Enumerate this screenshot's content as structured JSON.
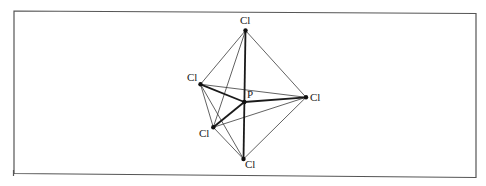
{
  "figure": {
    "central_atom": {
      "label": "P",
      "x": 244.3,
      "y": 102,
      "label_x": 247,
      "label_y": 98
    },
    "atoms": [
      {
        "id": "top",
        "label": "Cl",
        "x": 245.5,
        "y": 30.5,
        "label_x": 240,
        "label_y": 24
      },
      {
        "id": "left",
        "label": "Cl",
        "x": 200.5,
        "y": 84.3,
        "label_x": 187,
        "label_y": 81
      },
      {
        "id": "right",
        "label": "Cl",
        "x": 306,
        "y": 97.3,
        "label_x": 310,
        "label_y": 101
      },
      {
        "id": "lower-left",
        "label": "Cl",
        "x": 213.3,
        "y": 127.3,
        "label_x": 199,
        "label_y": 137
      },
      {
        "id": "bottom",
        "label": "Cl",
        "x": 243.5,
        "y": 159,
        "label_x": 245,
        "label_y": 168
      }
    ],
    "bonds_bold": [
      [
        "top",
        "bottom"
      ],
      [
        "P",
        "left"
      ],
      [
        "P",
        "right"
      ],
      [
        "P",
        "lower-left"
      ]
    ],
    "edges_thin": [
      [
        "top",
        "left"
      ],
      [
        "top",
        "lower-left"
      ],
      [
        "top",
        "right"
      ],
      [
        "left",
        "right"
      ],
      [
        "left",
        "lower-left"
      ],
      [
        "left",
        "bottom"
      ],
      [
        "lower-left",
        "right"
      ],
      [
        "lower-left",
        "bottom"
      ],
      [
        "right",
        "bottom"
      ]
    ],
    "frame": {
      "x1": 14,
      "y1": 11,
      "x2": 476,
      "y2": 174
    }
  }
}
